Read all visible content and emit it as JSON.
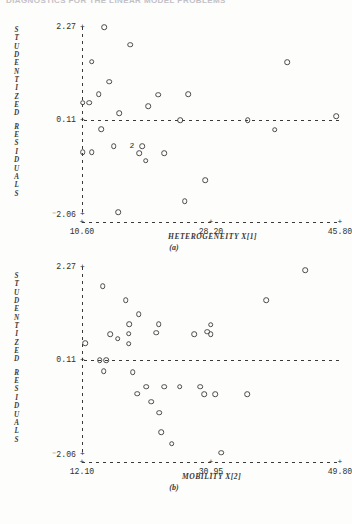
{
  "running_head": "DIAGNOSTICS FOR THE LINEAR MODEL PROBLEMS",
  "y_axis": {
    "title_letters": [
      "S",
      "T",
      "U",
      "D",
      "E",
      "N",
      "T",
      "I",
      "Z",
      "E",
      "D",
      "",
      "R",
      "E",
      "S",
      "I",
      "D",
      "U",
      "A",
      "L",
      "S"
    ],
    "title_text": "STUDENTIZED RESIDUALS",
    "ticks": [
      "2.27",
      "0.11",
      "2.06"
    ],
    "tick_values": [
      2.27,
      0.11,
      -2.06
    ],
    "negative_flags": [
      false,
      false,
      true
    ]
  },
  "chart_data": [
    {
      "type": "scatter",
      "panel": "(a)",
      "title": "",
      "xlabel": "HETEROGENEITY  X[1]",
      "ylabel": "STUDENTIZED RESIDUALS",
      "xticks": [
        "10.60",
        "28.20",
        "45.80"
      ],
      "xtick_values": [
        10.6,
        28.2,
        45.8
      ],
      "yticks": [
        "2.27",
        "0.11",
        "-2.06"
      ],
      "ytick_values": [
        2.27,
        0.11,
        -2.06
      ],
      "xlim": [
        10.6,
        45.8
      ],
      "ylim": [
        -2.06,
        2.27
      ],
      "grid": false,
      "reference_line_y": 0.11,
      "points": [
        {
          "x": 13.6,
          "y": 2.27
        },
        {
          "x": 17.2,
          "y": 1.86
        },
        {
          "x": 11.9,
          "y": 1.47
        },
        {
          "x": 38.6,
          "y": 1.45
        },
        {
          "x": 14.3,
          "y": 1.0
        },
        {
          "x": 12.9,
          "y": 0.72
        },
        {
          "x": 21.0,
          "y": 0.7
        },
        {
          "x": 25.1,
          "y": 0.71
        },
        {
          "x": 10.7,
          "y": 0.52
        },
        {
          "x": 11.6,
          "y": 0.52
        },
        {
          "x": 19.6,
          "y": 0.44
        },
        {
          "x": 15.7,
          "y": 0.27
        },
        {
          "x": 45.3,
          "y": 0.2
        },
        {
          "x": 24.0,
          "y": 0.11
        },
        {
          "x": 33.2,
          "y": 0.11
        },
        {
          "x": 13.2,
          "y": -0.1
        },
        {
          "x": 36.9,
          "y": -0.11
        },
        {
          "x": 14.9,
          "y": -0.49
        },
        {
          "x": 17.4,
          "y": -0.49,
          "count": 2
        },
        {
          "x": 18.8,
          "y": -0.49
        },
        {
          "x": 10.7,
          "y": -0.63
        },
        {
          "x": 11.9,
          "y": -0.63
        },
        {
          "x": 18.4,
          "y": -0.65
        },
        {
          "x": 21.8,
          "y": -0.65
        },
        {
          "x": 19.3,
          "y": -0.83
        },
        {
          "x": 27.4,
          "y": -1.28
        },
        {
          "x": 24.6,
          "y": -1.76
        },
        {
          "x": 15.5,
          "y": -2.02
        }
      ],
      "multiplicity_glyph": "2",
      "caption": "(a)"
    },
    {
      "type": "scatter",
      "panel": "(b)",
      "title": "",
      "xlabel": "MOBILITY  X[2]",
      "ylabel": "STUDENTIZED RESIDUALS",
      "xticks": [
        "12.10",
        "30.95",
        "49.80"
      ],
      "xtick_values": [
        12.1,
        30.95,
        49.8
      ],
      "yticks": [
        "2.27",
        "0.11",
        "-2.06"
      ],
      "ytick_values": [
        2.27,
        0.11,
        -2.06
      ],
      "xlim": [
        12.1,
        49.8
      ],
      "ylim": [
        -2.06,
        2.27
      ],
      "grid": false,
      "reference_line_y": 0.11,
      "points": [
        {
          "x": 44.7,
          "y": 2.19
        },
        {
          "x": 15.1,
          "y": 1.82
        },
        {
          "x": 18.5,
          "y": 1.5
        },
        {
          "x": 39.0,
          "y": 1.5
        },
        {
          "x": 20.4,
          "y": 1.18
        },
        {
          "x": 19.0,
          "y": 0.95
        },
        {
          "x": 23.3,
          "y": 0.95
        },
        {
          "x": 30.9,
          "y": 0.93
        },
        {
          "x": 16.2,
          "y": 0.72
        },
        {
          "x": 28.5,
          "y": 0.71
        },
        {
          "x": 30.9,
          "y": 0.71
        },
        {
          "x": 18.9,
          "y": 0.73
        },
        {
          "x": 22.9,
          "y": 0.75
        },
        {
          "x": 30.4,
          "y": 0.77
        },
        {
          "x": 17.3,
          "y": 0.61
        },
        {
          "x": 12.6,
          "y": 0.5
        },
        {
          "x": 18.9,
          "y": 0.49
        },
        {
          "x": 14.7,
          "y": 0.11
        },
        {
          "x": 15.6,
          "y": 0.11
        },
        {
          "x": 15.3,
          "y": -0.14
        },
        {
          "x": 19.5,
          "y": -0.16
        },
        {
          "x": 21.5,
          "y": -0.5
        },
        {
          "x": 24.1,
          "y": -0.5
        },
        {
          "x": 26.4,
          "y": -0.5
        },
        {
          "x": 29.4,
          "y": -0.5
        },
        {
          "x": 20.2,
          "y": -0.66
        },
        {
          "x": 30.0,
          "y": -0.67
        },
        {
          "x": 31.6,
          "y": -0.67
        },
        {
          "x": 36.2,
          "y": -0.67
        },
        {
          "x": 22.2,
          "y": -0.85
        },
        {
          "x": 23.4,
          "y": -1.1
        },
        {
          "x": 23.7,
          "y": -1.56
        },
        {
          "x": 25.2,
          "y": -1.82
        },
        {
          "x": 32.4,
          "y": -2.03
        }
      ],
      "caption": "(b)"
    }
  ]
}
